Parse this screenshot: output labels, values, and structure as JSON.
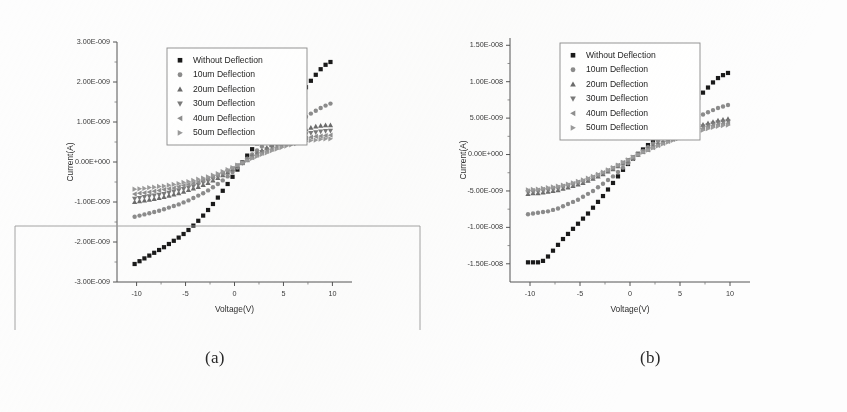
{
  "figure": {
    "caption_a": "(a)",
    "caption_b": "(b)",
    "background_color": "#fdfdfd",
    "scan_artifact_color": "#9a9a9a"
  },
  "legend": {
    "entries": [
      {
        "label": "Without Deflection",
        "marker": "square",
        "color": "#1a1a1a"
      },
      {
        "label": "10um Deflection",
        "marker": "circle",
        "color": "#8c8c8c"
      },
      {
        "label": "20um Deflection",
        "marker": "triangle-up",
        "color": "#6b6b6b"
      },
      {
        "label": "30um Deflection",
        "marker": "triangle-down",
        "color": "#7a7a7a"
      },
      {
        "label": "40um Deflection",
        "marker": "triangle-left",
        "color": "#8f8f8f"
      },
      {
        "label": "50um Deflection",
        "marker": "triangle-right",
        "color": "#9b9b9b"
      }
    ],
    "position": "upper-left-inside"
  },
  "chart_data": [
    {
      "panel": "a",
      "type": "scatter",
      "title": "",
      "xlabel": "Voltage(V)",
      "ylabel": "Current(A)",
      "xlim": [
        -12,
        12
      ],
      "ylim": [
        -3e-09,
        3e-09
      ],
      "grid": false,
      "xticks": [
        -10,
        -5,
        0,
        5,
        10
      ],
      "xticklabels": [
        "-10",
        "-5",
        "0",
        "5",
        "10"
      ],
      "yticks": [
        3e-09,
        2e-09,
        1e-09,
        0.0,
        -1e-09,
        -2e-09,
        -3e-09
      ],
      "yticklabels": [
        "3.00E-009",
        "2.00E-009",
        "1.00E-009",
        "0.00E+000",
        "-1.00E-009",
        "-2.00E-009",
        "-3.00E-009"
      ],
      "minor_ticks_per_interval": 1,
      "x": [
        -10.2,
        -9.7,
        -9.2,
        -8.7,
        -8.2,
        -7.7,
        -7.2,
        -6.7,
        -6.2,
        -5.7,
        -5.2,
        -4.7,
        -4.2,
        -3.7,
        -3.2,
        -2.7,
        -2.2,
        -1.7,
        -1.2,
        -0.7,
        -0.2,
        0.3,
        0.8,
        1.3,
        1.8,
        2.3,
        2.8,
        3.3,
        3.8,
        4.3,
        4.8,
        5.3,
        5.8,
        6.3,
        6.8,
        7.3,
        7.8,
        8.3,
        8.8,
        9.3,
        9.8
      ],
      "series": [
        {
          "name": "Without Deflection",
          "marker": "square",
          "color": "#1a1a1a",
          "values": [
            -2.55e-09,
            -2.48e-09,
            -2.41e-09,
            -2.34e-09,
            -2.27e-09,
            -2.2e-09,
            -2.13e-09,
            -2.05e-09,
            -1.97e-09,
            -1.89e-09,
            -1.8e-09,
            -1.7e-09,
            -1.59e-09,
            -1.47e-09,
            -1.34e-09,
            -1.2e-09,
            -1.05e-09,
            -8.9e-10,
            -7.2e-10,
            -5.5e-10,
            -3.7e-10,
            -1.9e-10,
            -1e-11,
            1.6e-10,
            3.2e-10,
            4.7e-10,
            6.1e-10,
            7.5e-10,
            8.8e-10,
            1.01e-09,
            1.15e-09,
            1.29e-09,
            1.43e-09,
            1.57e-09,
            1.72e-09,
            1.87e-09,
            2.03e-09,
            2.18e-09,
            2.32e-09,
            2.43e-09,
            2.5e-09
          ]
        },
        {
          "name": "10um Deflection",
          "marker": "circle",
          "color": "#8c8c8c",
          "values": [
            -1.37e-09,
            -1.34e-09,
            -1.31e-09,
            -1.28e-09,
            -1.25e-09,
            -1.22e-09,
            -1.18e-09,
            -1.14e-09,
            -1.1e-09,
            -1.06e-09,
            -1.01e-09,
            -9.6e-10,
            -9e-10,
            -8.4e-10,
            -7.8e-10,
            -7.1e-10,
            -6.3e-10,
            -5.5e-10,
            -4.6e-10,
            -3.6e-10,
            -2.5e-10,
            -1.4e-10,
            -3e-11,
            8e-11,
            1.9e-10,
            2.9e-10,
            3.9e-10,
            4.8e-10,
            5.7e-10,
            6.6e-10,
            7.4e-10,
            8.2e-10,
            9e-10,
            9.8e-10,
            1.06e-09,
            1.13e-09,
            1.21e-09,
            1.28e-09,
            1.35e-09,
            1.41e-09,
            1.46e-09
          ]
        },
        {
          "name": "20um Deflection",
          "marker": "triangle-up",
          "color": "#6b6b6b",
          "values": [
            -1e-09,
            -9.8e-10,
            -9.6e-10,
            -9.4e-10,
            -9.2e-10,
            -9e-10,
            -8.7e-10,
            -8.4e-10,
            -8.1e-10,
            -7.8e-10,
            -7.4e-10,
            -7e-10,
            -6.6e-10,
            -6.2e-10,
            -5.7e-10,
            -5.2e-10,
            -4.6e-10,
            -4e-10,
            -3.3e-10,
            -2.6e-10,
            -1.8e-10,
            -1e-10,
            -2e-11,
            6e-11,
            1.4e-10,
            2.1e-10,
            2.9e-10,
            3.6e-10,
            4.3e-10,
            5e-10,
            5.6e-10,
            6.2e-10,
            6.8e-10,
            7.3e-10,
            7.8e-10,
            8.2e-10,
            8.6e-10,
            8.9e-10,
            9.1e-10,
            9.2e-10,
            9.2e-10
          ]
        },
        {
          "name": "30um Deflection",
          "marker": "triangle-down",
          "color": "#7a7a7a",
          "values": [
            -9.2e-10,
            -9e-10,
            -8.8e-10,
            -8.6e-10,
            -8.4e-10,
            -8.2e-10,
            -8e-10,
            -7.7e-10,
            -7.4e-10,
            -7.1e-10,
            -6.8e-10,
            -6.4e-10,
            -6.1e-10,
            -5.7e-10,
            -5.2e-10,
            -4.8e-10,
            -4.3e-10,
            -3.7e-10,
            -3.1e-10,
            -2.4e-10,
            -1.7e-10,
            -9e-11,
            -2e-11,
            5e-11,
            1.2e-10,
            1.9e-10,
            2.5e-10,
            3.1e-10,
            3.7e-10,
            4.3e-10,
            4.8e-10,
            5.3e-10,
            5.8e-10,
            6.2e-10,
            6.6e-10,
            6.9e-10,
            7.2e-10,
            7.4e-10,
            7.6e-10,
            7.7e-10,
            7.8e-10
          ]
        },
        {
          "name": "40um Deflection",
          "marker": "triangle-left",
          "color": "#8f8f8f",
          "values": [
            -8e-10,
            -7.8e-10,
            -7.7e-10,
            -7.5e-10,
            -7.3e-10,
            -7.1e-10,
            -6.9e-10,
            -6.7e-10,
            -6.5e-10,
            -6.2e-10,
            -5.9e-10,
            -5.6e-10,
            -5.3e-10,
            -5e-10,
            -4.6e-10,
            -4.2e-10,
            -3.8e-10,
            -3.3e-10,
            -2.8e-10,
            -2.2e-10,
            -1.6e-10,
            -9e-11,
            -2e-11,
            5e-11,
            1.1e-10,
            1.7e-10,
            2.2e-10,
            2.7e-10,
            3.2e-10,
            3.7e-10,
            4.2e-10,
            4.6e-10,
            5e-10,
            5.4e-10,
            5.7e-10,
            6e-10,
            6.2e-10,
            6.4e-10,
            6.5e-10,
            6.6e-10,
            6.7e-10
          ]
        },
        {
          "name": "50um Deflection",
          "marker": "triangle-right",
          "color": "#9b9b9b",
          "values": [
            -6.8e-10,
            -6.7e-10,
            -6.6e-10,
            -6.4e-10,
            -6.3e-10,
            -6.1e-10,
            -6e-10,
            -5.8e-10,
            -5.6e-10,
            -5.4e-10,
            -5.1e-10,
            -4.9e-10,
            -4.6e-10,
            -4.3e-10,
            -4e-10,
            -3.7e-10,
            -3.3e-10,
            -2.9e-10,
            -2.4e-10,
            -1.9e-10,
            -1.4e-10,
            -8e-11,
            -2e-11,
            4e-11,
            9e-11,
            1.4e-10,
            1.9e-10,
            2.3e-10,
            2.8e-10,
            3.2e-10,
            3.6e-10,
            4e-10,
            4.3e-10,
            4.6e-10,
            4.9e-10,
            5.2e-10,
            5.4e-10,
            5.5e-10,
            5.7e-10,
            5.8e-10,
            5.8e-10
          ]
        }
      ]
    },
    {
      "panel": "b",
      "type": "scatter",
      "title": "",
      "xlabel": "Voltage(V)",
      "ylabel": "Current(A)",
      "xlim": [
        -12,
        12
      ],
      "ylim": [
        -1.75e-08,
        1.6e-08
      ],
      "grid": false,
      "xticks": [
        -10,
        -5,
        0,
        5,
        10
      ],
      "xticklabels": [
        "-10",
        "-5",
        "0",
        "5",
        "10"
      ],
      "yticks": [
        1.5e-08,
        1e-08,
        5e-09,
        0.0,
        -5e-09,
        -1e-08,
        -1.5e-08
      ],
      "yticklabels": [
        "1.50E-008",
        "1.00E-008",
        "5.00E-009",
        "0.00E+000",
        "-5.00E-009",
        "-1.00E-008",
        "-1.50E-008"
      ],
      "minor_ticks_per_interval": 1,
      "x": [
        -10.2,
        -9.7,
        -9.2,
        -8.7,
        -8.2,
        -7.7,
        -7.2,
        -6.7,
        -6.2,
        -5.7,
        -5.2,
        -4.7,
        -4.2,
        -3.7,
        -3.2,
        -2.7,
        -2.2,
        -1.7,
        -1.2,
        -0.7,
        -0.2,
        0.3,
        0.8,
        1.3,
        1.8,
        2.3,
        2.8,
        3.3,
        3.8,
        4.3,
        4.8,
        5.3,
        5.8,
        6.3,
        6.8,
        7.3,
        7.8,
        8.3,
        8.8,
        9.3,
        9.8
      ],
      "series": [
        {
          "name": "Without Deflection",
          "marker": "square",
          "color": "#1a1a1a",
          "values": [
            -1.48e-08,
            -1.48e-08,
            -1.48e-08,
            -1.46e-08,
            -1.4e-08,
            -1.32e-08,
            -1.24e-08,
            -1.16e-08,
            -1.09e-08,
            -1.02e-08,
            -9.5e-09,
            -8.8e-09,
            -8.1e-09,
            -7.3e-09,
            -6.5e-09,
            -5.7e-09,
            -4.8e-09,
            -3.9e-09,
            -3e-09,
            -2.1e-09,
            -1.3e-09,
            -6e-10,
            1e-10,
            7e-10,
            1.3e-09,
            1.9e-09,
            2.5e-09,
            3.1e-09,
            3.7e-09,
            4.3e-09,
            5e-09,
            5.7e-09,
            6.4e-09,
            7.1e-09,
            7.8e-09,
            8.5e-09,
            9.2e-09,
            9.9e-09,
            1.05e-08,
            1.09e-08,
            1.12e-08
          ]
        },
        {
          "name": "10um Deflection",
          "marker": "circle",
          "color": "#8c8c8c",
          "values": [
            -8.2e-09,
            -8.1e-09,
            -8e-09,
            -7.9e-09,
            -7.8e-09,
            -7.6e-09,
            -7.4e-09,
            -7.1e-09,
            -6.8e-09,
            -6.5e-09,
            -6.2e-09,
            -5.8e-09,
            -5.4e-09,
            -5e-09,
            -4.5e-09,
            -4e-09,
            -3.5e-09,
            -3e-09,
            -2.4e-09,
            -1.8e-09,
            -1.2e-09,
            -6e-10,
            0.0,
            5e-10,
            1e-09,
            1.5e-09,
            1.9e-09,
            2.4e-09,
            2.8e-09,
            3.2e-09,
            3.6e-09,
            4e-09,
            4.4e-09,
            4.8e-09,
            5.2e-09,
            5.5e-09,
            5.8e-09,
            6.1e-09,
            6.4e-09,
            6.6e-09,
            6.8e-09
          ]
        },
        {
          "name": "20um Deflection",
          "marker": "triangle-up",
          "color": "#6b6b6b",
          "values": [
            -5.4e-09,
            -5.3e-09,
            -5.3e-09,
            -5.2e-09,
            -5.1e-09,
            -5e-09,
            -4.9e-09,
            -4.7e-09,
            -4.5e-09,
            -4.3e-09,
            -4.1e-09,
            -3.9e-09,
            -3.6e-09,
            -3.3e-09,
            -3e-09,
            -2.7e-09,
            -2.3e-09,
            -2e-09,
            -1.6e-09,
            -1.2e-09,
            -8e-10,
            -4e-10,
            0.0,
            4e-10,
            7e-10,
            1.1e-09,
            1.4e-09,
            1.7e-09,
            2e-09,
            2.3e-09,
            2.6e-09,
            2.9e-09,
            3.2e-09,
            3.5e-09,
            3.8e-09,
            4.1e-09,
            4.3e-09,
            4.5e-09,
            4.7e-09,
            4.8e-09,
            4.9e-09
          ]
        },
        {
          "name": "30um Deflection",
          "marker": "triangle-down",
          "color": "#7a7a7a",
          "values": [
            -5.2e-09,
            -5.15e-09,
            -5.1e-09,
            -5e-09,
            -4.9e-09,
            -4.8e-09,
            -4.7e-09,
            -4.5e-09,
            -4.35e-09,
            -4.15e-09,
            -3.95e-09,
            -3.75e-09,
            -3.5e-09,
            -3.2e-09,
            -2.9e-09,
            -2.6e-09,
            -2.25e-09,
            -1.9e-09,
            -1.55e-09,
            -1.15e-09,
            -7.8e-10,
            -3.8e-10,
            0.0,
            3.7e-10,
            6.8e-10,
            1e-09,
            1.32e-09,
            1.6e-09,
            1.9e-09,
            2.18e-09,
            2.45e-09,
            2.73e-09,
            3e-09,
            3.28e-09,
            3.55e-09,
            3.82e-09,
            4e-09,
            4.2e-09,
            4.4e-09,
            4.5e-09,
            4.55e-09
          ]
        },
        {
          "name": "40um Deflection",
          "marker": "triangle-left",
          "color": "#8f8f8f",
          "values": [
            -5e-09,
            -4.95e-09,
            -4.9e-09,
            -4.8e-09,
            -4.7e-09,
            -4.6e-09,
            -4.5e-09,
            -4.35e-09,
            -4.2e-09,
            -4e-09,
            -3.8e-09,
            -3.6e-09,
            -3.35e-09,
            -3.1e-09,
            -2.8e-09,
            -2.5e-09,
            -2.18e-09,
            -1.85e-09,
            -1.5e-09,
            -1.12e-09,
            -7.5e-10,
            -3.6e-10,
            0.0,
            3.5e-10,
            6.5e-10,
            9.5e-10,
            1.25e-09,
            1.52e-09,
            1.8e-09,
            2.07e-09,
            2.33e-09,
            2.6e-09,
            2.85e-09,
            3.1e-09,
            3.35e-09,
            3.6e-09,
            3.8e-09,
            4e-09,
            4.15e-09,
            4.25e-09,
            4.3e-09
          ]
        },
        {
          "name": "50um Deflection",
          "marker": "triangle-right",
          "color": "#9b9b9b",
          "values": [
            -4.85e-09,
            -4.8e-09,
            -4.75e-09,
            -4.65e-09,
            -4.55e-09,
            -4.45e-09,
            -4.35e-09,
            -4.2e-09,
            -4.05e-09,
            -3.88e-09,
            -3.68e-09,
            -3.48e-09,
            -3.25e-09,
            -3e-09,
            -2.72e-09,
            -2.42e-09,
            -2.12e-09,
            -1.8e-09,
            -1.45e-09,
            -1.08e-09,
            -7.2e-10,
            -3.5e-10,
            0.0,
            3.3e-10,
            6.2e-10,
            9e-10,
            1.18e-09,
            1.45e-09,
            1.7e-09,
            1.95e-09,
            2.2e-09,
            2.45e-09,
            2.68e-09,
            2.9e-09,
            3.12e-09,
            3.35e-09,
            3.55e-09,
            3.72e-09,
            3.88e-09,
            3.98e-09,
            4.05e-09
          ]
        }
      ]
    }
  ]
}
